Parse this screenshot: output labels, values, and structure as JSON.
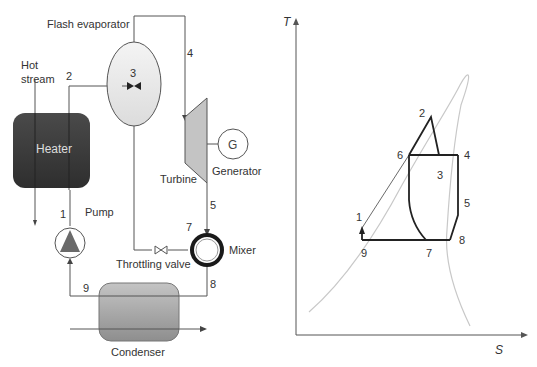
{
  "schematic": {
    "labels": {
      "flash_evaporator": "Flash evaporator",
      "hot_stream_line1": "Hot",
      "hot_stream_line2": "stream",
      "heater": "Heater",
      "pump": "Pump",
      "turbine": "Turbine",
      "generator": "Generator",
      "generator_symbol": "G",
      "mixer": "Mixer",
      "throttling_valve": "Throttling valve",
      "condenser": "Condenser"
    },
    "state_points": {
      "p1": "1",
      "p2": "2",
      "p3": "3",
      "p4": "4",
      "p5": "5",
      "p7": "7",
      "p8": "8",
      "p9": "9"
    },
    "colors": {
      "heater": "#3a3a3a",
      "flash_evaporator": "#e8e8e8",
      "turbine": "#c8c8c8",
      "pump": "#6a6a6a",
      "condenser": "#a8a8a8",
      "lines": "#555555"
    }
  },
  "ts_diagram": {
    "y_axis": "T",
    "x_axis": "S",
    "points": {
      "p1": "1",
      "p2": "2",
      "p3": "3",
      "p4": "4",
      "p5": "5",
      "p6": "6",
      "p7": "7",
      "p8": "8",
      "p9": "9"
    }
  }
}
